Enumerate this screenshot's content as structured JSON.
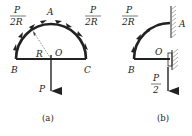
{
  "figure_a": {
    "caption": "(a)",
    "labels": {
      "A": "A",
      "B": "B",
      "C": "C",
      "O": "O",
      "R": "R",
      "P": "P"
    },
    "load_left": {
      "num": "P",
      "den": "2R"
    },
    "load_right": {
      "num": "P",
      "den": "2R"
    }
  },
  "figure_b": {
    "caption": "(b)",
    "labels": {
      "A": "A",
      "B": "B",
      "O": "O"
    },
    "load": {
      "num": "P",
      "den": "2R"
    },
    "force": {
      "num": "P",
      "den": "2"
    }
  },
  "colors": {
    "stroke": "#222222",
    "hatch": "#666666"
  }
}
